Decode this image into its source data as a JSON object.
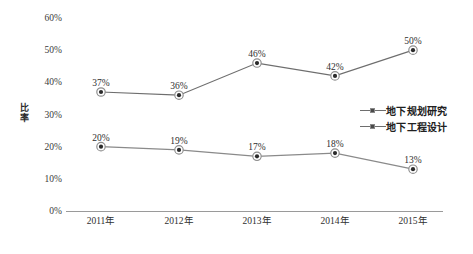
{
  "chart_data": {
    "type": "line",
    "title": "",
    "xlabel": "",
    "ylabel": "比率",
    "categories": [
      "2011年",
      "2012年",
      "2013年",
      "2014年",
      "2015年"
    ],
    "ylim": [
      0,
      60
    ],
    "ytick_step": 10,
    "ytick_labels": [
      "60%",
      "50%",
      "40%",
      "30%",
      "20%",
      "10%",
      "0%"
    ],
    "ytick_values": [
      60,
      50,
      40,
      30,
      20,
      10,
      0
    ],
    "grid": false,
    "legend_position": "center-right",
    "series": [
      {
        "name": "地下规划研究",
        "values": [
          37,
          36,
          46,
          42,
          50
        ],
        "labels": [
          "37%",
          "36%",
          "46%",
          "42%",
          "50%"
        ],
        "color": "#6e6e6e",
        "marker": "circle"
      },
      {
        "name": "地下工程设计",
        "values": [
          20,
          19,
          17,
          18,
          13
        ],
        "labels": [
          "20%",
          "19%",
          "17%",
          "18%",
          "13%"
        ],
        "color": "#8a8a8a",
        "marker": "circle"
      }
    ]
  },
  "legend": {
    "items": [
      {
        "label": "地下规划研究"
      },
      {
        "label": "地下工程设计"
      }
    ]
  },
  "colors": {
    "line": "#6e6e6e",
    "marker_fill": "#2b2b2b",
    "marker_ring": "#8e8e8e",
    "axis": "#9a9a9a",
    "text": "#2f2f2f",
    "background": "#ffffff"
  }
}
